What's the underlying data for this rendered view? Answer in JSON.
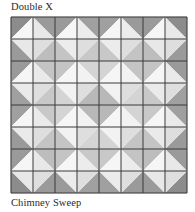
{
  "figure": {
    "title": "Double X",
    "caption": "Chimney Sweep"
  },
  "quilt": {
    "grid_size": 8,
    "block_size": 2,
    "line_color": "#3a3a3a",
    "diamond_tones": [
      [
        "#e8e8e8",
        "#ececec",
        "#ececec",
        "#e8e8e8"
      ],
      [
        "#eaeaea",
        "#f2f2f2",
        "#f2f2f2",
        "#eaeaea"
      ],
      [
        "#eaeaea",
        "#f2f2f2",
        "#f2f2f2",
        "#eaeaea"
      ],
      [
        "#e8e8e8",
        "#ececec",
        "#ececec",
        "#e8e8e8"
      ]
    ],
    "corner_tones": [
      [
        [
          "#8c8c8c",
          "#9a9a9a",
          "#9a9a9a",
          "#bdbdbd"
        ],
        [
          "#9a9a9a",
          "#a0a0a0",
          "#c4c4c4",
          "#c8c8c8"
        ],
        [
          "#a0a0a0",
          "#9a9a9a",
          "#c8c8c8",
          "#c4c4c4"
        ],
        [
          "#9a9a9a",
          "#8c8c8c",
          "#bdbdbd",
          "#9a9a9a"
        ]
      ],
      [
        [
          "#9a9a9a",
          "#c4c4c4",
          "#a0a0a0",
          "#c8c8c8"
        ],
        [
          "#c4c4c4",
          "#d4d4d4",
          "#d4d4d4",
          "#b8b8b8"
        ],
        [
          "#d4d4d4",
          "#c4c4c4",
          "#b8b8b8",
          "#d4d4d4"
        ],
        [
          "#c4c4c4",
          "#9a9a9a",
          "#c8c8c8",
          "#a0a0a0"
        ]
      ],
      [
        [
          "#a0a0a0",
          "#c8c8c8",
          "#9a9a9a",
          "#c4c4c4"
        ],
        [
          "#d4d4d4",
          "#b8b8b8",
          "#c4c4c4",
          "#d4d4d4"
        ],
        [
          "#b8b8b8",
          "#d4d4d4",
          "#d4d4d4",
          "#c4c4c4"
        ],
        [
          "#c8c8c8",
          "#a0a0a0",
          "#c4c4c4",
          "#9a9a9a"
        ]
      ],
      [
        [
          "#9a9a9a",
          "#bdbdbd",
          "#8c8c8c",
          "#9a9a9a"
        ],
        [
          "#c4c4c4",
          "#c8c8c8",
          "#9a9a9a",
          "#a0a0a0"
        ],
        [
          "#c8c8c8",
          "#c4c4c4",
          "#a0a0a0",
          "#9a9a9a"
        ],
        [
          "#bdbdbd",
          "#9a9a9a",
          "#9a9a9a",
          "#8c8c8c"
        ]
      ]
    ]
  }
}
